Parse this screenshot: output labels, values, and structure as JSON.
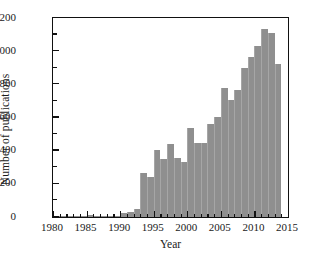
{
  "chart_data": {
    "type": "bar",
    "title": "",
    "xlabel": "Year",
    "ylabel": "Number of publications",
    "xlim": [
      1980,
      2015
    ],
    "ylim": [
      0,
      1200
    ],
    "grid": false,
    "legend": null,
    "bar_color": "#8f8f8f",
    "axis_color": "#111111",
    "background_color": "#ffffff",
    "xticks": [
      1980,
      1985,
      1990,
      1995,
      2000,
      2005,
      2010,
      2015
    ],
    "xtick_labels": [
      "1980",
      "1985",
      "1990",
      "1995",
      "2000",
      "2005",
      "2010",
      "2015"
    ],
    "xminor_step": 1,
    "yticks": [
      0,
      200,
      400,
      600,
      800,
      1000,
      1200
    ],
    "ytick_labels": [
      "0",
      "200",
      "400",
      "600",
      "800",
      "1000",
      "1200"
    ],
    "yminor_step": 100,
    "categories": [
      1980,
      1981,
      1982,
      1983,
      1984,
      1985,
      1986,
      1987,
      1988,
      1989,
      1990,
      1991,
      1992,
      1993,
      1994,
      1995,
      1996,
      1997,
      1998,
      1999,
      2000,
      2001,
      2002,
      2003,
      2004,
      2005,
      2006,
      2007,
      2008,
      2009,
      2010,
      2011,
      2012,
      2013
    ],
    "values": [
      6,
      5,
      5,
      5,
      6,
      12,
      6,
      7,
      7,
      8,
      22,
      31,
      47,
      265,
      240,
      405,
      347,
      440,
      353,
      333,
      538,
      445,
      445,
      560,
      601,
      780,
      706,
      767,
      896,
      962,
      1031,
      1132,
      1110,
      925
    ]
  }
}
